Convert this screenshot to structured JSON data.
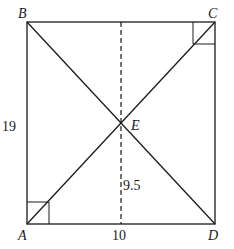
{
  "diagram": {
    "type": "geometry-rectangle-with-diagonals",
    "vertices": {
      "A": {
        "label": "A"
      },
      "B": {
        "label": "B"
      },
      "C": {
        "label": "C"
      },
      "D": {
        "label": "D"
      },
      "E": {
        "label": "E"
      }
    },
    "measurements": {
      "side_AB": "19",
      "base_AD": "10",
      "height_E": "9.5"
    },
    "right_angle_marks": [
      "A",
      "C"
    ],
    "line_color": "#1a1a1a"
  }
}
